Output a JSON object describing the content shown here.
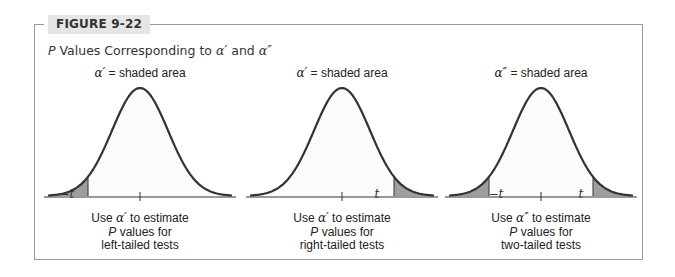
{
  "figure": {
    "label": "FIGURE 9-22",
    "subtitle_prefix": "P",
    "subtitle_text": " Values Corresponding to ",
    "alpha1": "α′",
    "subtitle_and": " and ",
    "alpha2": "α″",
    "colors": {
      "frame": "#9a9a9a",
      "label_bg": "#e6e6e6",
      "curve": "#333333",
      "shade": "#9e9e9e",
      "fill": "#fbfbfb"
    }
  },
  "panels": [
    {
      "caption_symbol": "α′",
      "caption_text": " = shaded area",
      "shade": "left",
      "ticks": {
        "left": "−t",
        "right": ""
      },
      "desc_line1_pre": "Use ",
      "desc_line1_symbol": "α′",
      "desc_line1_post": " to estimate",
      "desc_line2_p": "P",
      "desc_line2_rest": " values for",
      "desc_line3": "left-tailed tests"
    },
    {
      "caption_symbol": "α′",
      "caption_text": " = shaded area",
      "shade": "right",
      "ticks": {
        "left": "",
        "right": "t"
      },
      "desc_line1_pre": "Use ",
      "desc_line1_symbol": "α′",
      "desc_line1_post": " to estimate",
      "desc_line2_p": "P",
      "desc_line2_rest": " values for",
      "desc_line3": "right-tailed tests"
    },
    {
      "caption_symbol": "α″",
      "caption_text": " = shaded area",
      "shade": "both",
      "ticks": {
        "left": "−t",
        "right": "t"
      },
      "desc_line1_pre": "Use ",
      "desc_line1_symbol": "α″",
      "desc_line1_post": " to estimate",
      "desc_line2_p": "P",
      "desc_line2_rest": " values for",
      "desc_line3": "two-tailed tests"
    }
  ]
}
